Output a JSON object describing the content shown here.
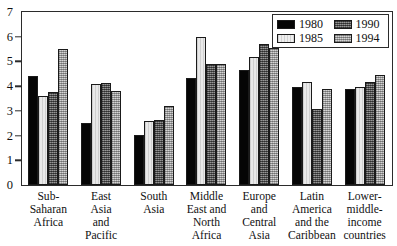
{
  "chart_data": {
    "type": "bar",
    "title": "",
    "subtitle": "",
    "xlabel": "",
    "ylabel": "",
    "ylim": [
      0,
      7
    ],
    "yticks": [
      0,
      1,
      2,
      3,
      4,
      5,
      6,
      7
    ],
    "ytick_labels": [
      "0",
      "1",
      "2",
      "3",
      "4",
      "5",
      "6",
      "7"
    ],
    "grid": false,
    "legend_position": "top-right",
    "categories": [
      "Sub-\nSaharan\nAfrica",
      "East\nAsia\nand\nPacific",
      "South\nAsia",
      "Middle\nEast and\nNorth\nAfrica",
      "Europe\nand\nCentral\nAsia",
      "Latin\nAmerica\nand the\nCaribbean",
      "Lower-\nmiddle-\nincome\ncountries"
    ],
    "series": [
      {
        "name": "1980",
        "color": "#050505",
        "values": [
          4.4,
          2.52,
          2.02,
          4.32,
          4.66,
          3.98,
          3.87
        ]
      },
      {
        "name": "1985",
        "color": "#e9e9e9",
        "values": [
          3.6,
          4.09,
          2.6,
          6.0,
          5.2,
          4.17,
          3.96
        ]
      },
      {
        "name": "1990",
        "color": "#6e6e6e",
        "values": [
          3.75,
          4.13,
          2.65,
          4.9,
          5.7,
          3.09,
          4.17
        ]
      },
      {
        "name": "1994",
        "color": "#b9b9b9",
        "values": [
          5.52,
          3.79,
          3.19,
          4.91,
          5.55,
          3.88,
          4.45
        ]
      }
    ],
    "legend_entries": [
      {
        "label": "1980",
        "swatch": "s1980"
      },
      {
        "label": "1990",
        "swatch": "s1990"
      },
      {
        "label": "1985",
        "swatch": "s1985"
      },
      {
        "label": "1994",
        "swatch": "s1994"
      }
    ]
  }
}
